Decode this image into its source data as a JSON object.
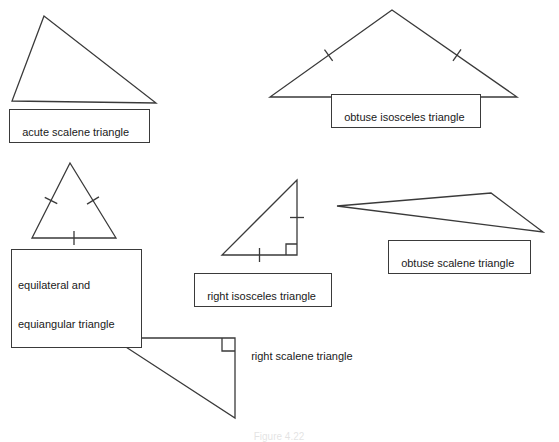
{
  "figure": {
    "background_color": "#ffffff",
    "stroke_color": "#3a3a3a",
    "text_color": "#1a1a1a",
    "caption": "Figure 4.22"
  },
  "labels": {
    "acute_scalene": "acute scalene triangle",
    "obtuse_isosceles": "obtuse isosceles triangle",
    "equilateral_line1": "equilateral and",
    "equilateral_line2": "equiangular triangle",
    "right_isosceles": "right isosceles triangle",
    "obtuse_scalene": "obtuse scalene triangle",
    "right_scalene": "right scalene triangle"
  },
  "chart_data": {
    "type": "diagram",
    "shapes": [
      {
        "name": "acute-scalene-triangle",
        "label": "acute scalene triangle",
        "vertices": [
          [
            44,
            16
          ],
          [
            12,
            101
          ],
          [
            156,
            103
          ]
        ],
        "tick_marks": [],
        "right_angle": null
      },
      {
        "name": "obtuse-isosceles-triangle",
        "label": "obtuse isosceles triangle",
        "vertices": [
          [
            392,
            10
          ],
          [
            270,
            97
          ],
          [
            517,
            97
          ]
        ],
        "tick_marks": [
          {
            "on_edge": [
              [
                392,
                10
              ],
              [
                270,
                97
              ]
            ],
            "t": 0.52
          },
          {
            "on_edge": [
              [
                392,
                10
              ],
              [
                517,
                97
              ]
            ],
            "t": 0.52
          }
        ],
        "right_angle": null
      },
      {
        "name": "equilateral-triangle",
        "label": "equilateral and equiangular triangle",
        "vertices": [
          [
            70,
            163
          ],
          [
            32,
            238
          ],
          [
            116,
            238
          ]
        ],
        "tick_marks": [
          {
            "on_edge": [
              [
                70,
                163
              ],
              [
                32,
                238
              ]
            ],
            "t": 0.5
          },
          {
            "on_edge": [
              [
                70,
                163
              ],
              [
                116,
                238
              ]
            ],
            "t": 0.5
          },
          {
            "on_edge": [
              [
                32,
                238
              ],
              [
                116,
                238
              ]
            ],
            "t": 0.5
          }
        ],
        "right_angle": null
      },
      {
        "name": "right-isosceles-triangle",
        "label": "right isosceles triangle",
        "vertices": [
          [
            297,
            180
          ],
          [
            222,
            255
          ],
          [
            297,
            255
          ]
        ],
        "tick_marks": [
          {
            "on_edge": [
              [
                297,
                180
              ],
              [
                297,
                255
              ]
            ],
            "t": 0.5
          },
          {
            "on_edge": [
              [
                222,
                255
              ],
              [
                297,
                255
              ]
            ],
            "t": 0.5
          }
        ],
        "right_angle": {
          "corner": [
            297,
            255
          ],
          "size": 11
        }
      },
      {
        "name": "obtuse-scalene-triangle",
        "label": "obtuse scalene triangle",
        "vertices": [
          [
            337,
            206
          ],
          [
            491,
            193
          ],
          [
            543,
            232
          ]
        ],
        "tick_marks": [],
        "right_angle": null
      },
      {
        "name": "right-scalene-triangle",
        "label": "right scalene triangle",
        "vertices": [
          [
            112,
            338
          ],
          [
            235,
            338
          ],
          [
            235,
            418
          ]
        ],
        "tick_marks": [],
        "right_angle": {
          "corner": [
            235,
            338
          ],
          "size": 13
        }
      }
    ]
  }
}
